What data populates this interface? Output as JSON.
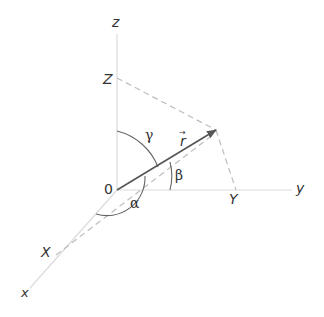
{
  "diagram": {
    "type": "3d-coordinate-direction-angles",
    "axes": {
      "x": {
        "label": "x"
      },
      "y": {
        "label": "y"
      },
      "z": {
        "label": "z"
      }
    },
    "origin": {
      "label": "0"
    },
    "projections": {
      "X": {
        "label": "X"
      },
      "Y": {
        "label": "Y"
      },
      "Z": {
        "label": "Z"
      }
    },
    "vector": {
      "label": "r",
      "arrow_mark": "→"
    },
    "angles": {
      "alpha": {
        "label": "α"
      },
      "beta": {
        "label": "β"
      },
      "gamma": {
        "label": "γ"
      }
    },
    "colors": {
      "axis": "#d8d8d8",
      "dashed": "#bdbdbd",
      "vector": "#555555",
      "arc": "#666666",
      "text": "#333333"
    }
  }
}
